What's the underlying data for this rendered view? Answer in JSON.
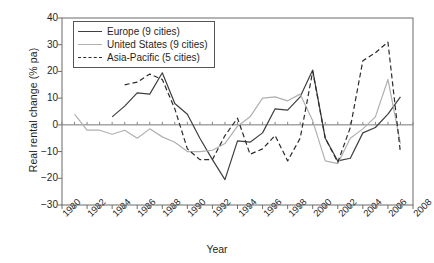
{
  "chart_data": {
    "type": "line",
    "title": "",
    "xlabel": "Year",
    "ylabel": "Real rental change (% pa)",
    "xlim": [
      1980,
      2008
    ],
    "ylim": [
      -30,
      40
    ],
    "grid": false,
    "legend_position": "top-left",
    "x_tick_labels": [
      "1980",
      "1982",
      "1984",
      "1986",
      "1988",
      "1990",
      "1992",
      "1994",
      "1996",
      "1998",
      "2000",
      "2002",
      "2004",
      "2006",
      "2008"
    ],
    "x_tick_values": [
      1980,
      1982,
      1984,
      1986,
      1988,
      1990,
      1992,
      1994,
      1996,
      1998,
      2000,
      2002,
      2004,
      2006,
      2008
    ],
    "y_tick_labels": [
      "40",
      "30",
      "20",
      "10",
      "0",
      "−10",
      "−20",
      "−30"
    ],
    "y_tick_values": [
      40,
      30,
      20,
      10,
      0,
      -10,
      -20,
      -30
    ],
    "zero_line": 0,
    "series": [
      {
        "name": "Europe (9 cities)",
        "color": "#3f3f3f",
        "style": "solid",
        "x": [
          1984,
          1985,
          1986,
          1987,
          1988,
          1989,
          1990,
          1991,
          1992,
          1993,
          1994,
          1995,
          1996,
          1997,
          1998,
          1999,
          2000,
          2001,
          2002,
          2003,
          2004,
          2005,
          2006,
          2007
        ],
        "values": [
          3,
          7,
          12,
          11.5,
          19.5,
          8,
          4,
          -5,
          -13,
          -20.5,
          -6,
          -6.5,
          -3,
          6,
          5.5,
          10.5,
          20.5,
          -5,
          -13.5,
          -12.5,
          -3,
          -1,
          4,
          10.5
        ]
      },
      {
        "name": "United States (9 cities)",
        "color": "#b0b0b0",
        "style": "solid",
        "x": [
          1981,
          1982,
          1983,
          1984,
          1985,
          1986,
          1987,
          1988,
          1989,
          1990,
          1991,
          1992,
          1993,
          1994,
          1995,
          1996,
          1997,
          1998,
          1999,
          2000,
          2001,
          2002,
          2003,
          2004,
          2005,
          2006,
          2007
        ],
        "values": [
          4,
          -2,
          -2,
          -3.5,
          -2,
          -5,
          -1.5,
          -4.5,
          -6.5,
          -10,
          -10,
          -9.5,
          -7,
          -0.5,
          3,
          10,
          10.5,
          9,
          11.5,
          1.5,
          -13.5,
          -14.5,
          -5,
          -1.5,
          3,
          17,
          -7
        ]
      },
      {
        "name": "Asia-Pacific (5 cities)",
        "color": "#2b2b2b",
        "style": "dashed",
        "x": [
          1985,
          1986,
          1987,
          1988,
          1989,
          1990,
          1991,
          1992,
          1993,
          1994,
          1995,
          1996,
          1997,
          1998,
          1999,
          2000,
          2001,
          2002,
          2003,
          2004,
          2005,
          2006,
          2007
        ],
        "values": [
          15,
          16,
          19,
          17,
          6,
          -9,
          -13,
          -13,
          -4,
          2.5,
          -11,
          -9,
          -4,
          -13.5,
          -5,
          20,
          -5,
          -14,
          -1,
          24,
          27,
          31,
          -10.5
        ]
      }
    ]
  }
}
